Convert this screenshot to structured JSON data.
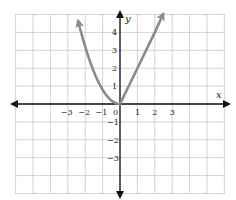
{
  "chart_data": {
    "type": "line",
    "title": "",
    "xlabel": "x",
    "ylabel": "y",
    "xlim": [
      -6,
      6
    ],
    "ylim": [
      -5,
      5
    ],
    "grid": true,
    "x_ticks": [
      "-3",
      "-2",
      "-1",
      "0",
      "1",
      "2",
      "3"
    ],
    "y_ticks": [
      "4",
      "3",
      "2",
      "1",
      "-1",
      "-2",
      "-3"
    ],
    "series": [
      {
        "name": "left branch (parabola, x ≤ 0)",
        "x": [
          -2.5,
          -2,
          -1.5,
          -1,
          -0.5,
          0
        ],
        "y": [
          5.0,
          3.2,
          1.8,
          0.8,
          0.2,
          0
        ],
        "arrow_end": true
      },
      {
        "name": "right branch (line, x ≥ 0)",
        "x": [
          0,
          1,
          2,
          2.47
        ],
        "y": [
          0,
          2.0,
          4.0,
          5.0
        ],
        "arrow_end": true
      }
    ],
    "colors": {
      "curve": "#8a8a8a",
      "axes": "#111111",
      "grid": "#c8c8c8"
    }
  }
}
